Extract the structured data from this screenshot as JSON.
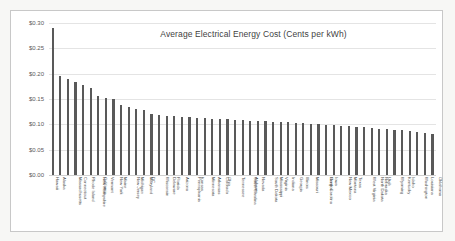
{
  "chart_data": {
    "type": "bar",
    "title": "Average Electrical Energy Cost (Cents per kWh)",
    "xlabel": "",
    "ylabel": "",
    "ylim": [
      0,
      0.3
    ],
    "grid": true,
    "legend": "none",
    "y_ticks": [
      "$0.00",
      "$0.05",
      "$0.10",
      "$0.15",
      "$0.20",
      "$0.25",
      "$0.30"
    ],
    "y_tick_values": [
      0.0,
      0.05,
      0.1,
      0.15,
      0.2,
      0.25,
      0.3
    ],
    "categories": [
      "Hawaii",
      "Alaska",
      "Massachusetts",
      "Connecticut",
      "Rhode Island",
      "New Hampshire",
      "California",
      "Vermont",
      "New York",
      "Maine",
      "New Jersey",
      "Michigan",
      "Maryland",
      "DC",
      "Wisconsin",
      "Delaware",
      "Florida",
      "Arizona",
      "Pennsylvania",
      "Kansas",
      "Minnesota",
      "Arkansas",
      "Colorado",
      "Ohio",
      "Tennessee",
      "South Carolina",
      "Alabama",
      "Nevada",
      "South Dakota",
      "Mississippi",
      "Virginia",
      "Indiana",
      "Georgia",
      "Illinois",
      "Missouri",
      "North Carolina",
      "Oregon",
      "Iowa",
      "New Mexico",
      "Montana",
      "Texas",
      "West Virginia",
      "North Dakota",
      "Nebraska",
      "Utah",
      "Wyoming",
      "Kentucky",
      "Idaho",
      "Washington",
      "Louisiana",
      "Oklahoma"
    ],
    "values": [
      0.29,
      0.195,
      0.189,
      0.183,
      0.178,
      0.172,
      0.155,
      0.152,
      0.15,
      0.139,
      0.134,
      0.131,
      0.129,
      0.121,
      0.118,
      0.117,
      0.116,
      0.115,
      0.114,
      0.113,
      0.112,
      0.111,
      0.11,
      0.11,
      0.109,
      0.108,
      0.107,
      0.107,
      0.106,
      0.105,
      0.105,
      0.104,
      0.103,
      0.102,
      0.101,
      0.1,
      0.099,
      0.098,
      0.097,
      0.096,
      0.095,
      0.094,
      0.093,
      0.091,
      0.09,
      0.089,
      0.088,
      0.086,
      0.085,
      0.083,
      0.081
    ],
    "series_color": "#595959",
    "gridline_color": "#e4e4e4"
  }
}
